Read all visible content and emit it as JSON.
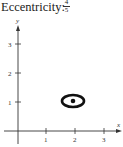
{
  "label": "Eccentricity:",
  "eccentricity": {
    "numerator": "4",
    "denominator": "5"
  },
  "axes": {
    "x_label": "x",
    "y_label": "y",
    "x_ticks": [
      "1",
      "2",
      "3"
    ],
    "y_ticks": [
      "1",
      "2",
      "3"
    ]
  },
  "ellipse": {
    "center": [
      2,
      1
    ],
    "semi_major": 0.5,
    "semi_minor": 0.25
  }
}
